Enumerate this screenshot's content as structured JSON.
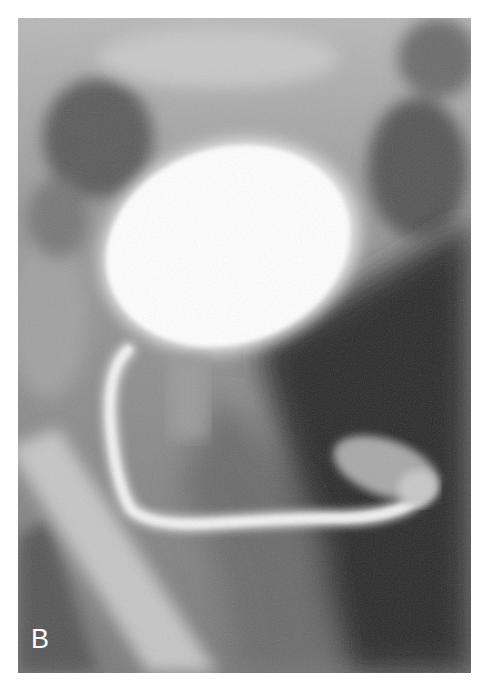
{
  "figure": {
    "type": "radiograph",
    "panel_label": "B",
    "colors": {
      "background": "#ffffff",
      "bladder": "#ffffff",
      "soft_tissue": "#8a8a8a",
      "dark_region": "#2a2a2a",
      "label": "#ffffff"
    }
  }
}
